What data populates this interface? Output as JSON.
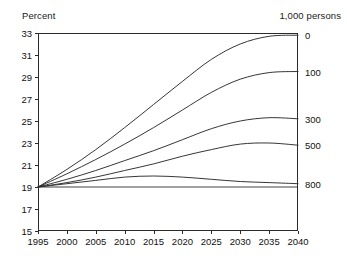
{
  "header": {
    "left_unit": "Percent",
    "right_unit": "1,000 persons",
    "clipped_title": ""
  },
  "chart_data": {
    "type": "line",
    "title": "",
    "xlabel": "",
    "ylabel": "Percent",
    "right_axis_label": "1,000 persons",
    "grid": false,
    "legend_position": "right-endpoint-labels",
    "xlim": [
      1995,
      2040
    ],
    "ylim": [
      15,
      33
    ],
    "xticks": [
      1995,
      2000,
      2005,
      2010,
      2015,
      2020,
      2025,
      2030,
      2035,
      2040
    ],
    "yticks": [
      15,
      17,
      19,
      21,
      23,
      25,
      27,
      29,
      31,
      33
    ],
    "x": [
      1995,
      2000,
      2005,
      2010,
      2015,
      2020,
      2025,
      2030,
      2035,
      2040
    ],
    "series": [
      {
        "name": "0",
        "label": "0",
        "end_label": "0",
        "values": [
          19.0,
          20.6,
          22.4,
          24.4,
          26.5,
          28.6,
          30.6,
          32.0,
          32.7,
          32.8
        ]
      },
      {
        "name": "100",
        "label": "100",
        "end_label": "100",
        "values": [
          19.0,
          20.2,
          21.5,
          22.9,
          24.4,
          26.0,
          27.6,
          28.8,
          29.4,
          29.5
        ]
      },
      {
        "name": "300",
        "label": "300",
        "end_label": "300",
        "values": [
          19.0,
          19.7,
          20.5,
          21.4,
          22.3,
          23.3,
          24.3,
          25.0,
          25.3,
          25.2
        ]
      },
      {
        "name": "500",
        "label": "500",
        "end_label": "500",
        "values": [
          19.0,
          19.4,
          19.9,
          20.5,
          21.1,
          21.8,
          22.4,
          22.9,
          23.0,
          22.8
        ]
      },
      {
        "name": "800",
        "label": "800",
        "end_label": "800",
        "values": [
          19.0,
          19.3,
          19.6,
          19.9,
          20.0,
          19.9,
          19.7,
          19.5,
          19.4,
          19.3
        ]
      }
    ],
    "reference_line": {
      "value": 19.0,
      "note": "flat baseline at 19 percent"
    }
  }
}
